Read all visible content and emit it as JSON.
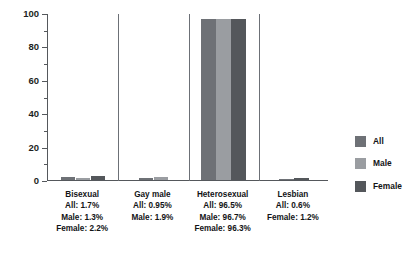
{
  "chart_data": {
    "type": "bar",
    "title": "",
    "subtitle": "",
    "xlabel": "",
    "ylabel": "",
    "ylim": [
      0,
      100
    ],
    "y_ticks": [
      0,
      20,
      40,
      60,
      80,
      100
    ],
    "y_minor_ticks": [
      10,
      30,
      50,
      70,
      90
    ],
    "grid": false,
    "legend_position": "right",
    "categories": [
      "Bisexual",
      "Gay male",
      "Heterosexual",
      "Lesbian"
    ],
    "series": [
      {
        "name": "All",
        "color": "#6e7176",
        "values": [
          1.7,
          0.95,
          96.5,
          0.6
        ]
      },
      {
        "name": "Male",
        "color": "#9a9da1",
        "values": [
          1.3,
          1.9,
          96.7,
          null
        ]
      },
      {
        "name": "Female",
        "color": "#54575b",
        "values": [
          2.2,
          null,
          96.3,
          1.2
        ]
      }
    ],
    "groups": [
      {
        "name": "Bisexual",
        "caption_lines": [
          "Bisexual",
          "All: 1.7%",
          "Male: 1.3%",
          "Female: 2.2%"
        ],
        "bars": [
          {
            "series": "All",
            "value": 1.7
          },
          {
            "series": "Male",
            "value": 1.3
          },
          {
            "series": "Female",
            "value": 2.2
          }
        ]
      },
      {
        "name": "Gay male",
        "caption_lines": [
          "Gay male",
          "All: 0.95%",
          "Male: 1.9%"
        ],
        "bars": [
          {
            "series": "All",
            "value": 0.95
          },
          {
            "series": "Male",
            "value": 1.9
          }
        ]
      },
      {
        "name": "Heterosexual",
        "caption_lines": [
          "Heterosexual",
          "All: 96.5%",
          "Male: 96.7%",
          "Female: 96.3%"
        ],
        "bars": [
          {
            "series": "All",
            "value": 96.5
          },
          {
            "series": "Male",
            "value": 96.7
          },
          {
            "series": "Female",
            "value": 96.3
          }
        ]
      },
      {
        "name": "Lesbian",
        "caption_lines": [
          "Lesbian",
          "All: 0.6%",
          "Female: 1.2%"
        ],
        "bars": [
          {
            "series": "All",
            "value": 0.6
          },
          {
            "series": "Female",
            "value": 1.2
          }
        ]
      }
    ]
  },
  "legend": {
    "items": [
      {
        "label": "All",
        "color": "#6e7176"
      },
      {
        "label": "Male",
        "color": "#9a9da1"
      },
      {
        "label": "Female",
        "color": "#54575b"
      }
    ]
  },
  "axis": {
    "y_tick_labels": [
      "0",
      "20",
      "40",
      "60",
      "80",
      "100"
    ]
  },
  "colors": {
    "all": "#6e7176",
    "male": "#9a9da1",
    "female": "#54575b",
    "axis": "#55585c",
    "divider": "#6c7076",
    "text": "#121416",
    "background": "#ffffff"
  }
}
